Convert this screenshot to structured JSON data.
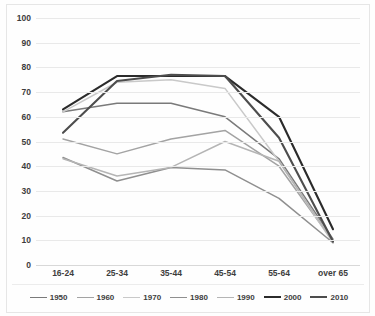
{
  "chart_data": {
    "type": "line",
    "title": "",
    "subtitle": "",
    "xlabel": "",
    "ylabel": "",
    "categories": [
      "16-24",
      "25-34",
      "35-44",
      "45-54",
      "55-64",
      "over 65"
    ],
    "ylim": [
      0,
      100
    ],
    "yticks": [
      0,
      10,
      20,
      30,
      40,
      50,
      60,
      70,
      80,
      90,
      100
    ],
    "grid": true,
    "legend_position": "bottom",
    "series": [
      {
        "name": "1950",
        "values": [
          62,
          65.5,
          65.5,
          60,
          43,
          10.5
        ],
        "color": "#7a7a7a",
        "width": 1.5
      },
      {
        "name": "1960",
        "values": [
          51,
          45,
          51,
          54.5,
          40,
          9.5
        ],
        "color": "#a3a3a3",
        "width": 1.5
      },
      {
        "name": "1970",
        "values": [
          62,
          74,
          75,
          71.5,
          42,
          9
        ],
        "color": "#c9c9c9",
        "width": 1.5
      },
      {
        "name": "1980",
        "values": [
          43.5,
          34,
          39.5,
          38.5,
          27,
          9
        ],
        "color": "#8f8f8f",
        "width": 1.5
      },
      {
        "name": "1990",
        "values": [
          43,
          36,
          39.5,
          50,
          42,
          9.5
        ],
        "color": "#b5b5b5",
        "width": 1.5
      },
      {
        "name": "2000",
        "values": [
          63,
          76.5,
          76.5,
          76.5,
          60,
          14.5
        ],
        "color": "#2b2b2b",
        "width": 2.1
      },
      {
        "name": "2010",
        "values": [
          53.5,
          74.5,
          77,
          76.5,
          51.5,
          9.5
        ],
        "color": "#4d4d4d",
        "width": 2.1
      }
    ]
  }
}
